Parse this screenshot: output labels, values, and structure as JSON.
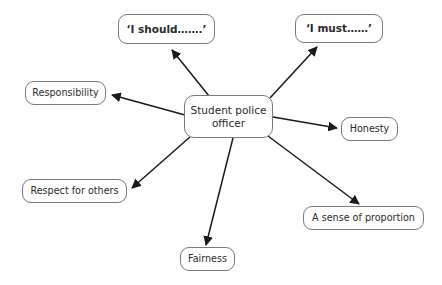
{
  "diagram": {
    "center": {
      "id": "center",
      "label": "Student police\nofficer"
    },
    "nodes": [
      {
        "id": "should",
        "label": "‘I should…….’"
      },
      {
        "id": "must",
        "label": "‘I must……’"
      },
      {
        "id": "responsibility",
        "label": "Responsibility"
      },
      {
        "id": "respect",
        "label": "Respect for others"
      },
      {
        "id": "fairness",
        "label": "Fairness"
      },
      {
        "id": "honesty",
        "label": "Honesty"
      },
      {
        "id": "proportion",
        "label": "A sense of proportion"
      }
    ],
    "edges": [
      {
        "id": "edge-center-should",
        "from": "center",
        "to": "should",
        "arrow": "to"
      },
      {
        "id": "edge-center-must",
        "from": "center",
        "to": "must",
        "arrow": "to"
      },
      {
        "id": "edge-center-responsibility",
        "from": "center",
        "to": "responsibility",
        "arrow": "to"
      },
      {
        "id": "edge-center-respect",
        "from": "center",
        "to": "respect",
        "arrow": "to"
      },
      {
        "id": "edge-center-fairness",
        "from": "center",
        "to": "fairness",
        "arrow": "to"
      },
      {
        "id": "edge-center-honesty",
        "from": "center",
        "to": "honesty",
        "arrow": "to"
      },
      {
        "id": "edge-center-proportion",
        "from": "center",
        "to": "proportion",
        "arrow": "to"
      }
    ],
    "colors": {
      "background": "#ffffff",
      "node_border": "#7a7a7a",
      "node_fill": "#ffffff",
      "text": "#2b2b2b",
      "edge": "#1a1a1a"
    }
  }
}
